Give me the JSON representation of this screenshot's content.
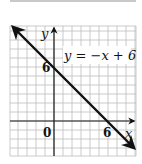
{
  "chart_data": {
    "type": "line",
    "title": "",
    "equation_label": "y = −x + 6",
    "xlabel": "x",
    "ylabel": "y",
    "origin_label": "0",
    "x_tick_labels": [
      "6"
    ],
    "y_tick_labels": [
      "6"
    ],
    "xlim": [
      -5,
      9
    ],
    "ylim": [
      -4,
      10.5
    ],
    "grid": true,
    "series": [
      {
        "name": "y = −x + 6",
        "x": [
          -5,
          0,
          6,
          9
        ],
        "y": [
          11,
          6,
          0,
          -3
        ],
        "arrows": "both"
      }
    ],
    "intercepts": {
      "y_intercept": [
        0,
        6
      ],
      "x_intercept": [
        6,
        0
      ]
    }
  },
  "labels": {
    "equation": "y = −x + 6",
    "x_axis": "x",
    "y_axis": "y",
    "origin": "0",
    "x_tick": "6",
    "y_tick": "6"
  },
  "colors": {
    "grid": "#bdbdbd",
    "axes": "#1a1a1a",
    "line": "#111111",
    "background": "#ffffff"
  }
}
